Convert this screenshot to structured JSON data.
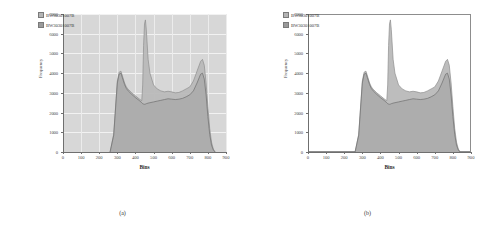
{
  "figure": {
    "panels": [
      {
        "caption": "(a)",
        "background_style": "gray-gridded",
        "legend": [
          {
            "label": "BW30301007B",
            "color": "#b4b4b4"
          },
          {
            "label": "BW30301007B",
            "color": "#9a9a9a"
          }
        ]
      },
      {
        "caption": "(b)",
        "background_style": "white-bordered",
        "legend": [
          {
            "label": "BW30301007B",
            "color": "#b4b4b4"
          },
          {
            "label": "BW30301007B",
            "color": "#9a9a9a"
          }
        ]
      }
    ]
  },
  "chart_data": [
    {
      "type": "area",
      "title": "",
      "xlabel": "Bins",
      "ylabel": "Frequency",
      "xlim": [
        0,
        900
      ],
      "ylim": [
        0,
        7000
      ],
      "xticks": [
        0,
        100,
        200,
        300,
        400,
        500,
        600,
        700,
        800,
        900
      ],
      "yticks": [
        0,
        1000,
        2000,
        3000,
        4000,
        5000,
        6000,
        7000
      ],
      "grid": true,
      "legend_position": "top-left",
      "x": [
        260,
        280,
        300,
        310,
        320,
        330,
        340,
        350,
        360,
        380,
        400,
        420,
        435,
        440,
        445,
        450,
        455,
        460,
        470,
        480,
        500,
        520,
        540,
        560,
        580,
        600,
        620,
        640,
        660,
        680,
        700,
        720,
        740,
        760,
        770,
        780,
        790,
        800,
        810,
        820,
        830,
        840
      ],
      "series": [
        {
          "name": "BW30301007B",
          "values": [
            0,
            900,
            3600,
            4050,
            4100,
            3800,
            3500,
            3300,
            3180,
            3000,
            2850,
            2700,
            2600,
            3400,
            5400,
            6500,
            6700,
            6200,
            4700,
            4000,
            3400,
            3200,
            3100,
            3050,
            3080,
            3050,
            3000,
            3020,
            3100,
            3200,
            3300,
            3600,
            4100,
            4600,
            4700,
            4400,
            3500,
            2300,
            1200,
            500,
            150,
            0
          ]
        },
        {
          "name": "BW30301007B",
          "values": [
            0,
            850,
            3500,
            3950,
            4000,
            3700,
            3420,
            3220,
            3100,
            2920,
            2760,
            2620,
            2500,
            2450,
            2430,
            2420,
            2430,
            2450,
            2480,
            2500,
            2540,
            2580,
            2620,
            2660,
            2700,
            2680,
            2660,
            2680,
            2720,
            2800,
            2900,
            3100,
            3500,
            3950,
            4000,
            3700,
            2900,
            1800,
            900,
            350,
            100,
            0
          ]
        }
      ]
    },
    {
      "type": "area",
      "title": "",
      "xlabel": "Bins",
      "ylabel": "Frequency",
      "xlim": [
        0,
        900
      ],
      "ylim": [
        0,
        7000
      ],
      "xticks": [
        0,
        100,
        200,
        300,
        400,
        500,
        600,
        700,
        800,
        900
      ],
      "yticks": [
        0,
        1000,
        2000,
        3000,
        4000,
        5000,
        6000,
        7000
      ],
      "grid": false,
      "legend_position": "top-left",
      "x": [
        260,
        280,
        300,
        310,
        320,
        330,
        340,
        350,
        360,
        380,
        400,
        420,
        435,
        440,
        445,
        450,
        455,
        460,
        470,
        480,
        500,
        520,
        540,
        560,
        580,
        600,
        620,
        640,
        660,
        680,
        700,
        720,
        740,
        760,
        770,
        780,
        790,
        800,
        810,
        820,
        830,
        840
      ],
      "series": [
        {
          "name": "BW30301007B",
          "values": [
            0,
            900,
            3600,
            4050,
            4100,
            3800,
            3500,
            3300,
            3180,
            3000,
            2850,
            2700,
            2600,
            3400,
            5400,
            6500,
            6700,
            6200,
            4700,
            4000,
            3400,
            3200,
            3100,
            3050,
            3080,
            3050,
            3000,
            3020,
            3100,
            3200,
            3300,
            3600,
            4100,
            4600,
            4700,
            4400,
            3500,
            2300,
            1200,
            500,
            150,
            0
          ]
        },
        {
          "name": "BW30301007B",
          "values": [
            0,
            850,
            3500,
            3950,
            4000,
            3700,
            3420,
            3220,
            3100,
            2920,
            2760,
            2620,
            2500,
            2450,
            2430,
            2420,
            2430,
            2450,
            2480,
            2500,
            2540,
            2580,
            2620,
            2660,
            2700,
            2680,
            2660,
            2680,
            2720,
            2800,
            2900,
            3100,
            3500,
            3950,
            4000,
            3700,
            2900,
            1800,
            900,
            350,
            100,
            0
          ]
        }
      ]
    }
  ]
}
